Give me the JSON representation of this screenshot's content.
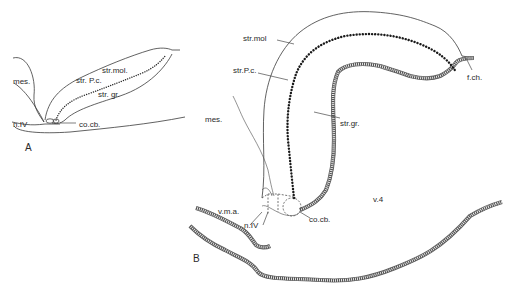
{
  "figure": {
    "panels": [
      {
        "id": "A",
        "label": "A",
        "annotations": {
          "mes": "mes.",
          "str_mol": "str.mol.",
          "str_pc": "str. P.c.",
          "str_gr": "str. gr.",
          "n_iv": "n.IV",
          "co_cb": "co.cb."
        }
      },
      {
        "id": "B",
        "label": "B",
        "annotations": {
          "str_mol": "str.mol",
          "str_pc": "str.P.c.",
          "mes": "mes.",
          "str_gr": "str.gr.",
          "f_ch": "f.ch.",
          "v4": "v.4",
          "v_m_a": "v.m.a.",
          "n_iv": "n.IV",
          "co_cb": "co.cb."
        }
      }
    ]
  }
}
